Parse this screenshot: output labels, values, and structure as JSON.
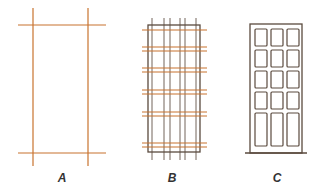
{
  "colors": {
    "grid_line": "#c8732e",
    "frame_line": "#5a4a3e",
    "label": "#333333"
  },
  "figures": [
    {
      "id": "A",
      "label": "A",
      "label_pos": [
        62,
        173
      ],
      "description": "Simple frame: two vertical and two horizontal grid lines",
      "verticals": [
        {
          "x": 33,
          "y1": 8,
          "y2": 166
        },
        {
          "x": 88,
          "y1": 8,
          "y2": 166
        }
      ],
      "horizontals": [
        {
          "y": 25,
          "x1": 18,
          "x2": 106
        },
        {
          "y": 153,
          "x1": 18,
          "x2": 106
        }
      ]
    },
    {
      "id": "B",
      "label": "B",
      "label_pos": [
        172,
        173
      ],
      "description": "Dense grid with frame outline",
      "frame": {
        "x": 148,
        "y": 25,
        "w": 52,
        "h": 127
      },
      "verticals_x": [
        152,
        164,
        170,
        180,
        185,
        196
      ],
      "verticals_span": [
        18,
        160
      ],
      "horizontals_y": [
        30,
        47,
        51,
        68,
        72,
        90,
        94,
        112,
        116,
        143,
        147
      ],
      "horizontals_span": [
        142,
        207
      ]
    },
    {
      "id": "C",
      "label": "C",
      "label_pos": [
        277,
        173
      ],
      "description": "Building facade with 3x5 windows",
      "outline": {
        "x": 250,
        "y": 24,
        "w": 52,
        "h": 129
      },
      "base": {
        "y": 153,
        "x1": 245,
        "x2": 307
      },
      "windows": {
        "cols_x": [
          255,
          271,
          287
        ],
        "rows_y": [
          29,
          50,
          71,
          92,
          113
        ],
        "w": 12,
        "h": [
          17,
          17,
          17,
          17,
          33
        ]
      }
    }
  ]
}
